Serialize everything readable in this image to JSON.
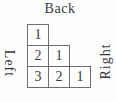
{
  "figure": {
    "labels": {
      "back": "Back",
      "left": "Left",
      "right": "Right"
    },
    "grid": {
      "rows": [
        {
          "cells": [
            "1"
          ]
        },
        {
          "cells": [
            "2",
            "1"
          ]
        },
        {
          "cells": [
            "3",
            "2",
            "1"
          ]
        }
      ]
    },
    "colors": {
      "background": "#fefefe",
      "cell_background": "#ffffff",
      "border": "#6e6e6e",
      "text": "#3a3a3a"
    }
  }
}
